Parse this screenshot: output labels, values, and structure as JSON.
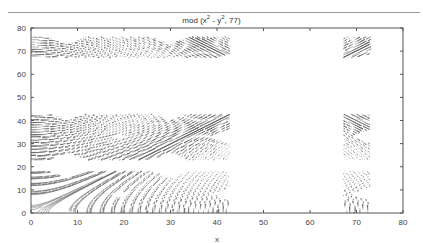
{
  "chart_data": {
    "type": "contour",
    "title_parts": {
      "prefix": "mod (x",
      "sup1": "2",
      "mid": " - y",
      "sup2": "2",
      "suffix": ", 77)"
    },
    "xlabel": "x",
    "ylabel": "",
    "xlim": [
      0,
      80
    ],
    "ylim": [
      0,
      80
    ],
    "xticks": [
      0,
      10,
      20,
      30,
      40,
      50,
      60,
      70,
      80
    ],
    "yticks": [
      0,
      10,
      20,
      30,
      40,
      50,
      60,
      70,
      80
    ],
    "grid": false,
    "legend": null,
    "contour_centers": [
      {
        "x": 30,
        "y": 33
      },
      {
        "x": 30,
        "y": 66
      },
      {
        "x": 60,
        "y": 33
      },
      {
        "x": 60,
        "y": 66
      },
      {
        "x": 8,
        "y": 33
      },
      {
        "x": 8,
        "y": 66
      },
      {
        "x": 30,
        "y": 8
      },
      {
        "x": 60,
        "y": 8
      },
      {
        "x": 8,
        "y": 8
      }
    ],
    "line_color": "#555555"
  }
}
